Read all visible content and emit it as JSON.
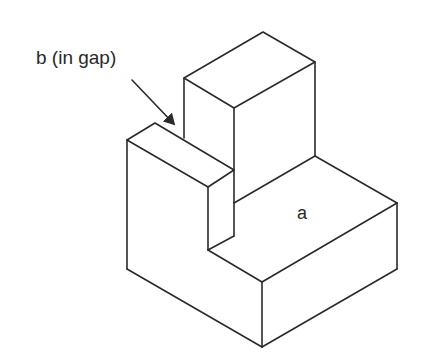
{
  "diagram": {
    "type": "isometric-solid",
    "labels": {
      "b": "b (in gap)",
      "a": "a"
    },
    "colors": {
      "stroke": "#2a2a2a",
      "background": "#ffffff"
    },
    "arrow": {
      "from": [
        132,
        80
      ],
      "to": [
        175,
        125
      ],
      "points_to": "gap"
    }
  }
}
